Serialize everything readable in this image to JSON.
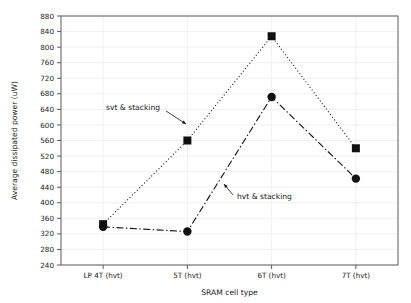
{
  "chart_data": {
    "type": "line",
    "title": "",
    "xlabel": "SRAM cell type",
    "ylabel": "Average dissipated power (uW)",
    "categories": [
      "LP 4T (hvt)",
      "5T (hvt)",
      "6T (hvt)",
      "7T (hvt)"
    ],
    "ylim": [
      240,
      880
    ],
    "ytick_step": 40,
    "yticks": [
      240,
      280,
      320,
      360,
      400,
      440,
      480,
      520,
      560,
      600,
      640,
      680,
      720,
      760,
      800,
      840,
      880
    ],
    "grid": true,
    "legend_position": "inline-annotations",
    "series": [
      {
        "name": "svt & stacking",
        "marker": "square",
        "linestyle": "dotted",
        "color": "#111111",
        "values": [
          345,
          560,
          828,
          540
        ]
      },
      {
        "name": "hvt & stacking",
        "marker": "circle",
        "linestyle": "dash-dot",
        "color": "#111111",
        "values": [
          338,
          326,
          672,
          462
        ]
      }
    ],
    "annotations": [
      {
        "text": "svt & stacking",
        "target_category": "5T (hvt)",
        "target_value": 607,
        "anchor": "left-of-arrow"
      },
      {
        "text": "hvt & stacking",
        "target_category": "between 5T and 6T",
        "target_value": 447,
        "anchor": "right-of-arrow"
      }
    ]
  },
  "axes": {
    "background_color": "#ffffff",
    "frame_color": "#5a5a66",
    "grid_color": "#e9e9ef"
  }
}
